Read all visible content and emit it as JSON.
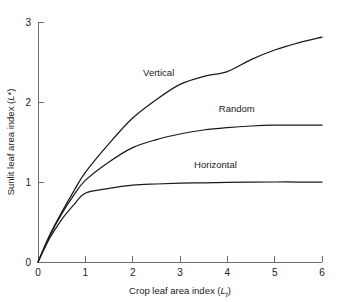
{
  "chart_data": {
    "type": "line",
    "title": "",
    "xlabel": "Crop leaf area index (L_t)",
    "xlabel_main": "Crop leaf area index (",
    "xlabel_symbol": "L",
    "xlabel_sub": "t",
    "xlabel_close": ")",
    "ylabel": "Sunlit leaf area index (L*)",
    "ylabel_main": "Sunlit leaf area index (",
    "ylabel_symbol": "L",
    "ylabel_sup": "*",
    "ylabel_close": ")",
    "xlim": [
      0,
      6
    ],
    "ylim": [
      0,
      3
    ],
    "xticks": [
      0,
      1,
      2,
      3,
      4,
      5,
      6
    ],
    "xtick_labels": [
      "0",
      "1",
      "2",
      "3",
      "4",
      "5",
      "6"
    ],
    "yticks": [
      0,
      1,
      2,
      3
    ],
    "ytick_labels": [
      "0",
      "1",
      "2",
      "3"
    ],
    "grid": false,
    "legend": "inline-curve-labels",
    "line_color": "#1a1a1a",
    "axis_color": "#6e6e6e",
    "background_color": "#ffffff",
    "x": [
      0,
      0.25,
      0.5,
      0.75,
      1,
      1.5,
      2,
      2.5,
      3,
      3.5,
      4,
      4.5,
      5,
      5.5,
      6
    ],
    "series": [
      {
        "name": "Vertical",
        "label": "Vertical",
        "label_x": 2.55,
        "label_y": 2.32,
        "values": [
          0,
          0.34,
          0.62,
          0.88,
          1.12,
          1.48,
          1.8,
          2.03,
          2.22,
          2.32,
          2.38,
          2.53,
          2.65,
          2.74,
          2.81
        ]
      },
      {
        "name": "Random",
        "label": "Random",
        "label_x": 4.2,
        "label_y": 1.87,
        "values": [
          0,
          0.33,
          0.6,
          0.83,
          1.02,
          1.25,
          1.43,
          1.53,
          1.6,
          1.65,
          1.68,
          1.7,
          1.71,
          1.71,
          1.71
        ]
      },
      {
        "name": "Horizontal",
        "label": "Horizontal",
        "label_x": 3.75,
        "label_y": 1.17,
        "values": [
          0,
          0.3,
          0.53,
          0.71,
          0.86,
          0.92,
          0.96,
          0.975,
          0.985,
          0.99,
          0.995,
          0.998,
          1.0,
          1.0,
          1.0
        ]
      }
    ]
  }
}
